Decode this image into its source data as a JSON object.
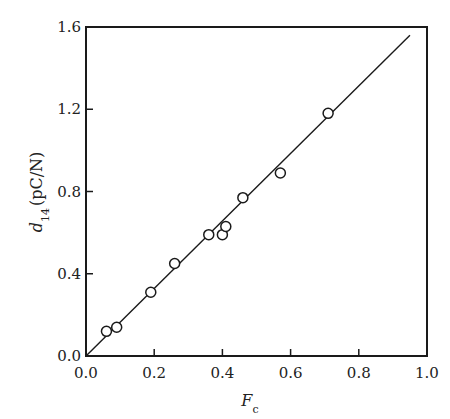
{
  "chart_data": {
    "type": "scatter",
    "title": "",
    "xlabel": "F_c",
    "xlabel_main": "F",
    "xlabel_sub": "c",
    "ylabel": "d_14 (pC/N)",
    "ylabel_main": "d",
    "ylabel_sub": "14",
    "ylabel_unit": "(pC/N)",
    "xlim": [
      0.0,
      1.0
    ],
    "ylim": [
      0.0,
      1.6
    ],
    "xticks": [
      "0.0",
      "0.2",
      "0.4",
      "0.6",
      "0.8",
      "1.0"
    ],
    "yticks": [
      "0.0",
      "0.4",
      "0.8",
      "1.2",
      "1.6"
    ],
    "grid": false,
    "legend": null,
    "series": [
      {
        "name": "measured",
        "marker": "open-circle",
        "points": [
          {
            "x": 0.06,
            "y": 0.12
          },
          {
            "x": 0.09,
            "y": 0.14
          },
          {
            "x": 0.19,
            "y": 0.31
          },
          {
            "x": 0.26,
            "y": 0.45
          },
          {
            "x": 0.36,
            "y": 0.59
          },
          {
            "x": 0.4,
            "y": 0.59
          },
          {
            "x": 0.41,
            "y": 0.63
          },
          {
            "x": 0.46,
            "y": 0.77
          },
          {
            "x": 0.57,
            "y": 0.89
          },
          {
            "x": 0.71,
            "y": 1.18
          }
        ]
      },
      {
        "name": "linear fit",
        "type": "line",
        "points": [
          {
            "x": 0.0,
            "y": 0.0
          },
          {
            "x": 0.95,
            "y": 1.56
          }
        ]
      }
    ]
  }
}
